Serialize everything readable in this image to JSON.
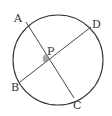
{
  "diagram": {
    "type": "circle-with-intersecting-chords",
    "circle": {
      "cx": 58,
      "cy": 60,
      "r": 45
    },
    "points": {
      "A": {
        "label": "A",
        "x": 26,
        "y": 22
      },
      "B": {
        "label": "B",
        "x": 20,
        "y": 82
      },
      "C": {
        "label": "C",
        "x": 74,
        "y": 98
      },
      "D": {
        "label": "D",
        "x": 91,
        "y": 27
      },
      "P": {
        "label": "P",
        "x": 49,
        "y": 59
      }
    },
    "chords": [
      {
        "from": "A",
        "to": "C"
      },
      {
        "from": "B",
        "to": "D"
      }
    ],
    "angle_marker": {
      "at": "P",
      "between": [
        "A",
        "B"
      ],
      "color": "#9a9a9a"
    },
    "stroke_color": "#333333"
  }
}
